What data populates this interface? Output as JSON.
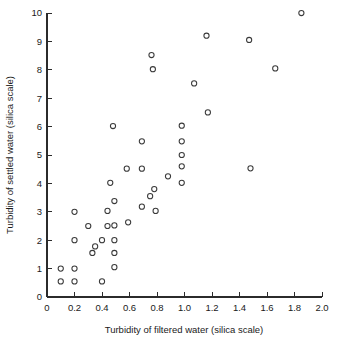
{
  "chart_data": {
    "type": "scatter",
    "title": "",
    "xlabel": "Turbidity of filtered water (silica scale)",
    "ylabel": "Turbidity of settled water (silica scale)",
    "xlim": [
      0,
      2.0
    ],
    "ylim": [
      0,
      10
    ],
    "grid": false,
    "legend": null,
    "marker": "open-circle",
    "xticks": [
      0,
      0.2,
      0.4,
      0.6,
      0.8,
      1.0,
      1.2,
      1.4,
      1.6,
      1.8,
      2.0
    ],
    "xtick_labels": [
      "0",
      "0.2",
      "0.4",
      "0.6",
      "0.8",
      "1.0",
      "1.2",
      "1.4",
      "1.6",
      "1.8",
      "2.0"
    ],
    "yticks": [
      0,
      1,
      2,
      3,
      4,
      5,
      6,
      7,
      8,
      9,
      10
    ],
    "ytick_labels": [
      "0",
      "1",
      "2",
      "3",
      "4",
      "5",
      "6",
      "7",
      "8",
      "9",
      "10"
    ],
    "points": [
      [
        0.1,
        1.0
      ],
      [
        0.1,
        0.55
      ],
      [
        0.2,
        3.0
      ],
      [
        0.2,
        2.0
      ],
      [
        0.2,
        1.0
      ],
      [
        0.2,
        0.55
      ],
      [
        0.3,
        2.5
      ],
      [
        0.33,
        1.55
      ],
      [
        0.35,
        1.78
      ],
      [
        0.4,
        2.0
      ],
      [
        0.4,
        0.55
      ],
      [
        0.44,
        3.03
      ],
      [
        0.44,
        2.5
      ],
      [
        0.46,
        4.02
      ],
      [
        0.48,
        6.02
      ],
      [
        0.49,
        3.38
      ],
      [
        0.49,
        2.52
      ],
      [
        0.49,
        2.0
      ],
      [
        0.49,
        1.55
      ],
      [
        0.49,
        1.05
      ],
      [
        0.58,
        4.52
      ],
      [
        0.59,
        2.63
      ],
      [
        0.69,
        5.48
      ],
      [
        0.69,
        4.52
      ],
      [
        0.69,
        3.18
      ],
      [
        0.75,
        3.55
      ],
      [
        0.76,
        8.52
      ],
      [
        0.77,
        8.02
      ],
      [
        0.78,
        3.8
      ],
      [
        0.79,
        3.03
      ],
      [
        0.88,
        4.25
      ],
      [
        0.98,
        6.03
      ],
      [
        0.98,
        5.48
      ],
      [
        0.98,
        5.0
      ],
      [
        0.98,
        4.6
      ],
      [
        0.98,
        4.02
      ],
      [
        1.07,
        7.52
      ],
      [
        1.16,
        9.2
      ],
      [
        1.17,
        6.5
      ],
      [
        1.47,
        9.05
      ],
      [
        1.48,
        4.53
      ],
      [
        1.66,
        8.05
      ],
      [
        1.85,
        10.0
      ]
    ]
  }
}
